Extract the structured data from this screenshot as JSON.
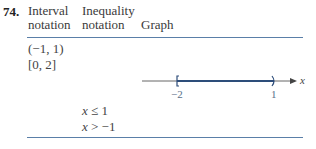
{
  "problem": {
    "number": "74.",
    "columns": {
      "interval": [
        "Interval",
        "notation"
      ],
      "inequality": [
        "Inequality",
        "notation"
      ],
      "graph": "Graph"
    },
    "interval_rows": [
      "(−1, 1)",
      "[0, 2]"
    ],
    "inequality_rows": [
      {
        "var": "x",
        "rest": " ≤ 1"
      },
      {
        "var": "x",
        "rest": " > −1"
      }
    ],
    "graph": {
      "left_label": "−2",
      "right_label": "1",
      "axis_label": "x",
      "left_endpoint": "closed-bracket",
      "right_endpoint": "open-parenthesis",
      "interval_from": -2,
      "interval_to": 1
    },
    "colors": {
      "rule": "#5a7fa8",
      "segment": "#2d4d7a"
    }
  }
}
